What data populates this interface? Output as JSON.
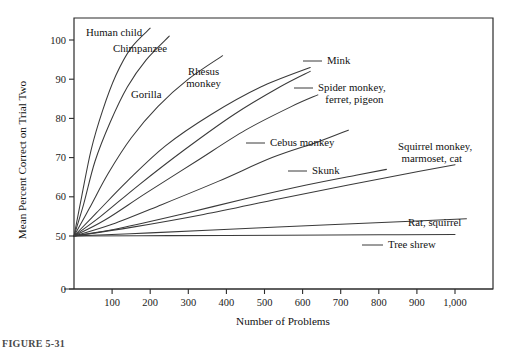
{
  "figure": {
    "caption": "FIGURE 5-31"
  },
  "chart_data": {
    "type": "line",
    "title": "",
    "xlabel": "Number of Problems",
    "ylabel": "Mean Percent Correct on Trial Two",
    "xlim": [
      0,
      1100
    ],
    "ylim": [
      50,
      103
    ],
    "grid": false,
    "legend_position": "inline-labels",
    "y_axis_break": true,
    "y_break_below": 50,
    "xticks": [
      0,
      100,
      200,
      300,
      400,
      500,
      600,
      700,
      800,
      900,
      1000
    ],
    "xticklabels": [
      "",
      "100",
      "200",
      "300",
      "400",
      "500",
      "600",
      "700",
      "800",
      "900",
      "1,000"
    ],
    "yticks": [
      0,
      50,
      60,
      70,
      80,
      90,
      100
    ],
    "yticklabels": [
      "0",
      "50",
      "60",
      "70",
      "80",
      "90",
      "100"
    ],
    "series": [
      {
        "name": "Human child",
        "label_lines": [
          "Human child"
        ],
        "label_x": 86,
        "label_y": 36,
        "label_anchor": "start",
        "leader": null,
        "x": [
          0,
          20,
          45,
          75,
          110,
          150,
          200
        ],
        "y": [
          50,
          60,
          72,
          82,
          91,
          98,
          103
        ]
      },
      {
        "name": "Chimpanzee",
        "label_lines": [
          "Chimpanzee"
        ],
        "label_x": 113,
        "label_y": 52,
        "label_anchor": "start",
        "leader": null,
        "x": [
          0,
          25,
          55,
          95,
          140,
          190,
          250
        ],
        "y": [
          50,
          58,
          69,
          79,
          88,
          95,
          101
        ]
      },
      {
        "name": "Gorilla",
        "label_lines": [
          "Gorilla"
        ],
        "label_x": 131,
        "label_y": 98,
        "label_anchor": "start",
        "leader": null,
        "x": [
          0,
          40,
          90,
          150,
          220,
          300,
          390
        ],
        "y": [
          50,
          57,
          66,
          75,
          83,
          90,
          96
        ]
      },
      {
        "name": "Rhesus monkey",
        "label_lines": [
          "Rhesus",
          "monkey"
        ],
        "label_x": 188,
        "label_y": 75,
        "label_anchor": "start",
        "leader": null,
        "x": [
          0,
          60,
          140,
          240,
          360,
          490,
          620
        ],
        "y": [
          50,
          56,
          64,
          73,
          81,
          88,
          93
        ]
      },
      {
        "name": "Mink",
        "label_lines": [
          "Mink"
        ],
        "label_x": 327,
        "label_y": 64,
        "label_anchor": "start",
        "leader": {
          "x1": 303,
          "y1": 61,
          "x2": 322,
          "y2": 61
        },
        "x": [
          0,
          70,
          170,
          290,
          420,
          540,
          620
        ],
        "y": [
          50,
          55,
          63,
          72,
          81,
          88,
          92
        ]
      },
      {
        "name": "Spider monkey, ferret, pigeon",
        "label_lines": [
          "Spider monkey,",
          "ferret, pigeon"
        ],
        "label_x": 318,
        "label_y": 91,
        "label_anchor": "start",
        "leader": {
          "x1": 294,
          "y1": 88,
          "x2": 313,
          "y2": 88
        },
        "x": [
          0,
          80,
          190,
          320,
          450,
          570,
          640
        ],
        "y": [
          50,
          54,
          61,
          69,
          77,
          83,
          86
        ]
      },
      {
        "name": "Cebus monkey",
        "label_lines": [
          "Cebus monkey"
        ],
        "label_x": 270,
        "label_y": 146,
        "label_anchor": "start",
        "leader": {
          "x1": 246,
          "y1": 143,
          "x2": 265,
          "y2": 143
        },
        "x": [
          0,
          100,
          230,
          380,
          520,
          640,
          720
        ],
        "y": [
          50,
          53,
          58,
          64,
          70,
          74,
          77
        ]
      },
      {
        "name": "Skunk",
        "label_lines": [
          "Skunk"
        ],
        "label_x": 312,
        "label_y": 174,
        "label_anchor": "start",
        "leader": {
          "x1": 288,
          "y1": 171,
          "x2": 307,
          "y2": 171
        },
        "x": [
          0,
          120,
          280,
          450,
          610,
          740,
          820
        ],
        "y": [
          50,
          52,
          55.5,
          59.5,
          63,
          65.5,
          67
        ]
      },
      {
        "name": "Squirrel monkey, marmoset, cat",
        "label_lines": [
          "Squirrel monkey,",
          "marmoset, cat"
        ],
        "label_x": 398,
        "label_y": 150,
        "label_anchor": "start",
        "leader": null,
        "x": [
          0,
          150,
          340,
          540,
          720,
          880,
          1000
        ],
        "y": [
          50,
          52.2,
          55.5,
          59.5,
          63,
          66,
          68.2
        ]
      },
      {
        "name": "Rat, squirrel",
        "label_lines": [
          "Rat, squirrel"
        ],
        "label_x": 408,
        "label_y": 226,
        "label_anchor": "start",
        "leader": null,
        "x": [
          0,
          200,
          450,
          700,
          900,
          1030
        ],
        "y": [
          50,
          50.8,
          51.9,
          53.0,
          53.8,
          54.4
        ]
      },
      {
        "name": "Tree shrew",
        "label_lines": [
          "Tree shrew"
        ],
        "label_x": 388,
        "label_y": 248,
        "label_anchor": "start",
        "leader": {
          "x1": 362,
          "y1": 245,
          "x2": 383,
          "y2": 245
        },
        "x": [
          0,
          250,
          550,
          800,
          1000
        ],
        "y": [
          50,
          50.1,
          50.2,
          50.3,
          50.4
        ]
      }
    ]
  }
}
